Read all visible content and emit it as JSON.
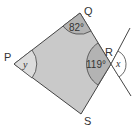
{
  "diagram": {
    "type": "geometry-quadrilateral",
    "vertices": {
      "P": {
        "label": "P"
      },
      "Q": {
        "label": "Q"
      },
      "R": {
        "label": "R"
      },
      "S": {
        "label": "S"
      }
    },
    "angles": {
      "Q": {
        "label": "82°",
        "value_deg": 82
      },
      "R_interior": {
        "label": "119°",
        "value_deg": 119
      },
      "R_exterior": {
        "label": "x"
      },
      "P": {
        "label": "y"
      }
    },
    "colors": {
      "fill": "#c9c9c9",
      "arc_fill": "#b3b3b3",
      "stroke": "#444444",
      "exterior_arc_fill": "#ffffff"
    }
  }
}
